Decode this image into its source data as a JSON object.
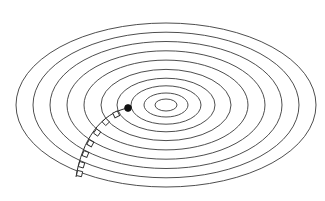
{
  "figure": {
    "title": "",
    "kind": "concentric-ellipse-contour-diagram",
    "canvas": {
      "width": 325,
      "height": 201,
      "background": "#ffffff"
    },
    "stroke_color": "#3a3a3a",
    "stroke_width": 0.9,
    "marker_color": "#111111"
  },
  "chart_data": {
    "type": "line",
    "title": "",
    "subtitle": "",
    "xlabel": "",
    "ylabel": "",
    "grid": false,
    "legend_position": "none",
    "projection": "oblique-perspective-of-concentric-circles",
    "center": {
      "x": 166,
      "y": 105
    },
    "aspect_ratio_ry_over_rx": 0.547,
    "ring_count": 10,
    "rings": [
      {
        "index": 1,
        "rx": 150,
        "ry": 82,
        "label": ""
      },
      {
        "index": 2,
        "rx": 133,
        "ry": 72.8,
        "label": ""
      },
      {
        "index": 3,
        "rx": 116,
        "ry": 63.5,
        "label": ""
      },
      {
        "index": 4,
        "rx": 99,
        "ry": 54.2,
        "label": ""
      },
      {
        "index": 5,
        "rx": 82,
        "ry": 44.9,
        "label": ""
      },
      {
        "index": 6,
        "rx": 65,
        "ry": 35.6,
        "label": ""
      },
      {
        "index": 7,
        "rx": 49,
        "ry": 26.8,
        "label": ""
      },
      {
        "index": 8,
        "rx": 35,
        "ry": 19.2,
        "label": ""
      },
      {
        "index": 9,
        "rx": 22,
        "ry": 12.0,
        "label": ""
      },
      {
        "index": 10,
        "rx": 11,
        "ry": 6.0,
        "label": ""
      }
    ],
    "center_marker": {
      "name": "center-point",
      "x": 128,
      "y": 108,
      "radius": 3.4,
      "filled": true,
      "label": ""
    },
    "path": {
      "name": "stepped-descent-path",
      "description": "curved path from center marker outward to lower-left rim",
      "start": {
        "x": 128,
        "y": 108
      },
      "end": {
        "x": 76,
        "y": 177
      },
      "control_points": [
        {
          "x": 101,
          "y": 113
        },
        {
          "x": 82,
          "y": 140
        }
      ],
      "points": [
        {
          "x": 128,
          "y": 108
        },
        {
          "x": 118,
          "y": 111
        },
        {
          "x": 109,
          "y": 116
        },
        {
          "x": 100,
          "y": 124
        },
        {
          "x": 93,
          "y": 133
        },
        {
          "x": 87,
          "y": 143
        },
        {
          "x": 82,
          "y": 154
        },
        {
          "x": 79,
          "y": 165
        },
        {
          "x": 76,
          "y": 177
        }
      ]
    },
    "path_ticks": {
      "name": "path-step-markers",
      "shape": "small-square",
      "count": 7,
      "size": 5.2,
      "positions": [
        {
          "x": 115,
          "y": 112
        },
        {
          "x": 104,
          "y": 120
        },
        {
          "x": 95,
          "y": 131
        },
        {
          "x": 88,
          "y": 142
        },
        {
          "x": 83,
          "y": 153
        },
        {
          "x": 79,
          "y": 164
        },
        {
          "x": 77,
          "y": 173
        }
      ]
    }
  }
}
